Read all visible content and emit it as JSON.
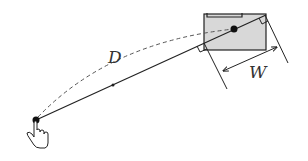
{
  "diagram": {
    "title": "",
    "labels": {
      "distance": "D",
      "width": "W"
    },
    "elements": {
      "start_point": {
        "x": 36,
        "y": 120
      },
      "target_center": {
        "x": 234,
        "y": 29
      },
      "target_box": {
        "x": 204,
        "y": 13,
        "width": 62,
        "height": 37
      },
      "pointer_icon": "hand-pointer-icon"
    },
    "colors": {
      "line": "#222222",
      "target_fill": "#d6d6d6",
      "dashed": "#555555",
      "background": "#ffffff"
    }
  }
}
